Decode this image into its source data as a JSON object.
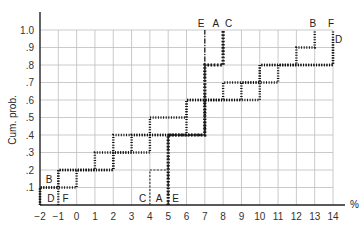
{
  "chart_data": {
    "type": "line",
    "subtype": "step (cumulative distribution)",
    "title": "",
    "xlabel": "%",
    "ylabel": "Cum. prob.",
    "xlim": [
      -2,
      14
    ],
    "ylim": [
      0,
      1.0
    ],
    "grid": true,
    "x_ticks": [
      "-2",
      "-1",
      "0",
      "1",
      "2",
      "3",
      "4",
      "5",
      "6",
      "7",
      "8",
      "9",
      "10",
      "11",
      "12",
      "13",
      "14"
    ],
    "y_ticks": [
      ".1",
      ".2",
      ".3",
      ".4",
      ".5",
      ".6",
      ".7",
      ".8",
      ".9",
      "1.0"
    ],
    "series": [
      {
        "name": "A",
        "style": "heavy dotted",
        "x": [
          5,
          5,
          7,
          7,
          8,
          8
        ],
        "y": [
          0,
          0.4,
          0.4,
          0.8,
          0.8,
          1.0
        ]
      },
      {
        "name": "B",
        "style": "dotted",
        "x": [
          -2,
          -2,
          0,
          0,
          2,
          2,
          4,
          4,
          6,
          6,
          8,
          8,
          10,
          10,
          12,
          12,
          13,
          13
        ],
        "y": [
          0,
          0.1,
          0.1,
          0.2,
          0.2,
          0.3,
          0.3,
          0.5,
          0.5,
          0.6,
          0.6,
          0.7,
          0.7,
          0.8,
          0.8,
          0.9,
          0.9,
          1.0
        ]
      },
      {
        "name": "C",
        "style": "dashed",
        "x": [
          4,
          4,
          5,
          5,
          7,
          7,
          8,
          8
        ],
        "y": [
          0,
          0.2,
          0.2,
          0.4,
          0.4,
          0.8,
          0.8,
          1.0
        ]
      },
      {
        "name": "D",
        "style": "dotted",
        "x": [
          -2,
          -2,
          -1,
          -1,
          2,
          2,
          6,
          6,
          10,
          10,
          14,
          14
        ],
        "y": [
          0,
          0.1,
          0.1,
          0.2,
          0.2,
          0.4,
          0.4,
          0.6,
          0.6,
          0.8,
          0.8,
          0.95
        ]
      },
      {
        "name": "E",
        "style": "dash-dot",
        "x": [
          5,
          5,
          7,
          7
        ],
        "y": [
          0,
          0.4,
          0.4,
          1.0
        ]
      },
      {
        "name": "F",
        "style": "dotted",
        "x": [
          -1,
          -1,
          1,
          1,
          3,
          3,
          7,
          7,
          9,
          9,
          11,
          11,
          14,
          14
        ],
        "y": [
          0,
          0.2,
          0.2,
          0.3,
          0.3,
          0.4,
          0.4,
          0.6,
          0.6,
          0.7,
          0.7,
          0.8,
          0.8,
          1.0
        ]
      }
    ],
    "annotations": [
      {
        "text": "B",
        "x": -1.5,
        "y": 0.15
      },
      {
        "text": "D",
        "x": -1.4,
        "y": 0.04
      },
      {
        "text": "F",
        "x": -0.6,
        "y": 0.04
      },
      {
        "text": "C",
        "x": 3.6,
        "y": 0.04
      },
      {
        "text": "A",
        "x": 4.5,
        "y": 0.04
      },
      {
        "text": "E",
        "x": 5.4,
        "y": 0.04
      },
      {
        "text": "E",
        "x": 6.8,
        "y": 1.04
      },
      {
        "text": "A",
        "x": 7.6,
        "y": 1.04
      },
      {
        "text": "C",
        "x": 8.3,
        "y": 1.04
      },
      {
        "text": "B",
        "x": 12.9,
        "y": 1.04
      },
      {
        "text": "F",
        "x": 13.9,
        "y": 1.04
      },
      {
        "text": "D",
        "x": 14.3,
        "y": 0.95
      }
    ]
  }
}
